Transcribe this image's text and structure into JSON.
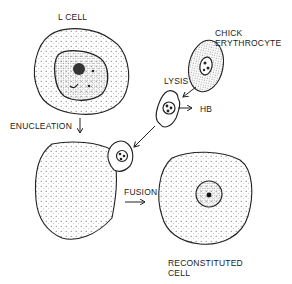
{
  "diagram": {
    "labels": {
      "l_cell": "L CELL",
      "chick_line1": "CHICK",
      "chick_line2": "ERYTHROCYTE",
      "lysis": "LYSIS",
      "hb": "HB",
      "enucleation": "ENUCLEATION",
      "fusion": "FUSION",
      "reconstituted_line1": "RECONSTITUTED",
      "reconstituted_line2": "CELL"
    },
    "colors": {
      "ink": "#222222",
      "background": "#ffffff"
    }
  }
}
